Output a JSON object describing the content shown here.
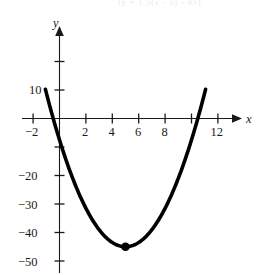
{
  "figure": {
    "kind": "cartesian-parabola-plot",
    "background": "#ffffff",
    "ink_color": "#000000",
    "axis_color": "#1a1a1a",
    "top_caption_fragment": "(y = 1.5(x - 5)  - 45)"
  },
  "chart_data": {
    "type": "line",
    "title": "",
    "subtitle": "",
    "xlabel": "x",
    "ylabel": "y",
    "grid": false,
    "legend": null,
    "xlim": [
      -2.8,
      13.2
    ],
    "ylim": [
      -56,
      25
    ],
    "x_ticks": [
      -2,
      0,
      2,
      4,
      6,
      8,
      10,
      12
    ],
    "x_tick_labels": [
      "-2",
      "",
      "2",
      "4",
      "6",
      "8",
      "",
      "12"
    ],
    "y_ticks": [
      20,
      10,
      -10,
      -20,
      -30,
      -40,
      -50
    ],
    "y_tick_labels": [
      "",
      "10",
      "",
      "-20",
      "-30",
      "-40",
      "-50"
    ],
    "series": [
      {
        "name": "parabola",
        "equation": "y = 1.5(x - 5)^2 - 45",
        "a": 1.5,
        "vertex": [
          5,
          -45
        ],
        "roots": [
          -0.48,
          10.48
        ],
        "y_intercept": 2.5,
        "x": [
          -0.9,
          -0.5,
          0,
          1,
          2,
          3,
          4,
          5,
          6,
          7,
          8,
          9,
          10,
          10.6
        ],
        "values": [
          7.2,
          -4.6,
          -7.5,
          -21,
          -31.5,
          -39,
          -43.5,
          -45,
          -43.5,
          -39,
          -31.5,
          -21,
          -7.5,
          5.1
        ]
      }
    ],
    "annotations": [
      {
        "name": "vertex-point",
        "x": 5,
        "y": -45,
        "label": "",
        "marker": "filled-circle"
      }
    ]
  },
  "labels": {
    "y_axis_name": "y",
    "x_axis_name": "x",
    "x_minus2": "−2",
    "x_2": "2",
    "x_4": "4",
    "x_6": "6",
    "x_8": "8",
    "x_12": "12",
    "y_10": "10",
    "y_minus20": "−20",
    "y_minus30": "−30",
    "y_minus40": "−40",
    "y_minus50": "−50"
  }
}
